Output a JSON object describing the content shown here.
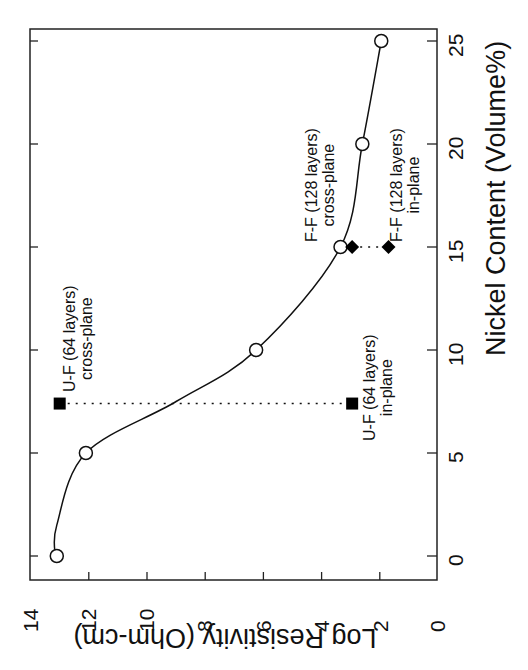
{
  "chart_data": {
    "type": "line",
    "orientation": "rotated 90 degrees counter-clockwise",
    "title": "",
    "xlabel": "Nickel Content (Volume%)",
    "ylabel": "Log Resistivity (Ohm-cm)",
    "xlim": [
      -1,
      26
    ],
    "ylim": [
      0,
      14
    ],
    "x_ticks": [
      "0",
      "5",
      "10",
      "15",
      "20",
      "25"
    ],
    "y_ticks": [
      "0",
      "2",
      "4",
      "6",
      "8",
      "10",
      "12",
      "14"
    ],
    "grid": false,
    "series": [
      {
        "name": "Cross-plane (fit curve with open circles)",
        "marker": "open-circle",
        "x": [
          0,
          5,
          10,
          15,
          20,
          25
        ],
        "y": [
          13.1,
          12.1,
          6.25,
          3.35,
          2.6,
          1.95
        ]
      },
      {
        "name": "U-F (64 layers)",
        "marker": "filled-square",
        "x": [
          7.4,
          7.4
        ],
        "y": [
          13.0,
          2.95
        ],
        "connector": "dotted"
      },
      {
        "name": "F-F (128 layers)",
        "marker": "filled-diamond",
        "x": [
          15,
          15
        ],
        "y": [
          2.95,
          1.7
        ],
        "connector": "dotted"
      }
    ],
    "annotations": [
      {
        "text": [
          "U-F (64 layers)",
          "cross-plane"
        ],
        "x": 7.4,
        "y": 13.0
      },
      {
        "text": [
          "U-F (64 layers)",
          "in-plane"
        ],
        "x": 7.4,
        "y": 2.95
      },
      {
        "text": [
          "F-F (128 layers)",
          "cross-plane"
        ],
        "x": 15,
        "y": 3.35
      },
      {
        "text": [
          "F-F (128 layers)",
          "in-plane"
        ],
        "x": 15,
        "y": 1.7
      }
    ]
  },
  "labels": {
    "xlabel": "Nickel Content (Volume%)",
    "ylabel": "Log Resistivity (Ohm-cm)",
    "x_ticks": [
      "0",
      "5",
      "10",
      "15",
      "20",
      "25"
    ],
    "y_ticks": [
      "0",
      "2",
      "4",
      "6",
      "8",
      "10",
      "12",
      "14"
    ],
    "annot_uf_cross_1": "U-F (64 layers)",
    "annot_uf_cross_2": "cross-plane",
    "annot_uf_in_1": "U-F (64 layers)",
    "annot_uf_in_2": "in-plane",
    "annot_ff_cross_1": "F-F (128 layers)",
    "annot_ff_cross_2": "cross-plane",
    "annot_ff_in_1": "F-F (128 layers)",
    "annot_ff_in_2": "in-plane"
  }
}
